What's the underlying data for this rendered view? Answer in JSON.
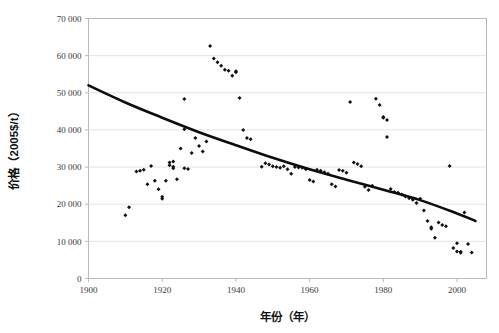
{
  "chart_data": {
    "type": "scatter",
    "title": "",
    "xlabel": "年份（年）",
    "ylabel": "价格（2005$/t）",
    "xlim": [
      1900,
      2008
    ],
    "ylim": [
      0,
      70000
    ],
    "grid": true,
    "legend": false,
    "xticks": [
      1900,
      1920,
      1940,
      1960,
      1980,
      2000
    ],
    "xtick_labels": [
      "1900",
      "1920",
      "1940",
      "1960",
      "1980",
      "2000"
    ],
    "yticks": [
      0,
      10000,
      20000,
      30000,
      40000,
      50000,
      60000,
      70000
    ],
    "ytick_labels": [
      "0",
      "10 000",
      "20 000",
      "30 000",
      "40 000",
      "50 000",
      "60 000",
      "70 000"
    ],
    "point_color": "#111111",
    "trend_color": "#0d0d0d",
    "grid_color": "#e2e2e2",
    "frame_color": "#b9b9b9",
    "series": [
      {
        "name": "价格观测值",
        "marker": "diamond",
        "points": [
          [
            1910,
            17000
          ],
          [
            1911,
            19200
          ],
          [
            1913,
            28800
          ],
          [
            1914,
            29000
          ],
          [
            1915,
            29300
          ],
          [
            1916,
            25400
          ],
          [
            1917,
            30300
          ],
          [
            1918,
            26300
          ],
          [
            1919,
            24000
          ],
          [
            1920,
            21500
          ],
          [
            1920,
            22000
          ],
          [
            1921,
            26300
          ],
          [
            1922,
            30500
          ],
          [
            1922,
            31200
          ],
          [
            1923,
            31500
          ],
          [
            1923,
            30100
          ],
          [
            1923,
            29700
          ],
          [
            1924,
            26700
          ],
          [
            1925,
            35000
          ],
          [
            1926,
            48300
          ],
          [
            1926,
            40200
          ],
          [
            1926,
            29700
          ],
          [
            1927,
            29500
          ],
          [
            1928,
            33800
          ],
          [
            1929,
            37800
          ],
          [
            1930,
            35700
          ],
          [
            1931,
            34200
          ],
          [
            1932,
            36900
          ],
          [
            1933,
            62600
          ],
          [
            1934,
            59200
          ],
          [
            1935,
            58200
          ],
          [
            1936,
            57300
          ],
          [
            1937,
            56200
          ],
          [
            1938,
            55900
          ],
          [
            1939,
            54600
          ],
          [
            1940,
            55800
          ],
          [
            1940,
            55500
          ],
          [
            1941,
            48600
          ],
          [
            1942,
            40000
          ],
          [
            1943,
            37800
          ],
          [
            1944,
            37500
          ],
          [
            1947,
            30100
          ],
          [
            1948,
            31000
          ],
          [
            1949,
            30700
          ],
          [
            1950,
            30200
          ],
          [
            1951,
            30000
          ],
          [
            1952,
            29800
          ],
          [
            1953,
            30200
          ],
          [
            1954,
            29400
          ],
          [
            1955,
            28200
          ],
          [
            1956,
            30000
          ],
          [
            1957,
            29900
          ],
          [
            1958,
            29800
          ],
          [
            1959,
            29400
          ],
          [
            1960,
            26500
          ],
          [
            1961,
            26100
          ],
          [
            1962,
            29300
          ],
          [
            1963,
            29000
          ],
          [
            1964,
            28600
          ],
          [
            1965,
            28200
          ],
          [
            1966,
            25400
          ],
          [
            1967,
            24800
          ],
          [
            1968,
            29200
          ],
          [
            1969,
            29000
          ],
          [
            1970,
            28500
          ],
          [
            1971,
            47500
          ],
          [
            1972,
            31200
          ],
          [
            1973,
            30800
          ],
          [
            1974,
            30200
          ],
          [
            1975,
            24700
          ],
          [
            1976,
            23800
          ],
          [
            1977,
            25000
          ],
          [
            1978,
            48400
          ],
          [
            1979,
            46700
          ],
          [
            1980,
            43500
          ],
          [
            1980,
            43300
          ],
          [
            1981,
            42700
          ],
          [
            1981,
            38100
          ],
          [
            1982,
            24100
          ],
          [
            1983,
            23300
          ],
          [
            1984,
            23100
          ],
          [
            1985,
            22600
          ],
          [
            1986,
            22100
          ],
          [
            1987,
            21600
          ],
          [
            1988,
            21200
          ],
          [
            1989,
            20300
          ],
          [
            1990,
            21500
          ],
          [
            1991,
            18300
          ],
          [
            1992,
            15500
          ],
          [
            1993,
            13800
          ],
          [
            1993,
            13400
          ],
          [
            1994,
            11000
          ],
          [
            1995,
            15100
          ],
          [
            1996,
            14400
          ],
          [
            1997,
            14100
          ],
          [
            1998,
            30300
          ],
          [
            1999,
            8200
          ],
          [
            2000,
            9500
          ],
          [
            2000,
            7300
          ],
          [
            2001,
            7200
          ],
          [
            2001,
            6900
          ],
          [
            2002,
            17800
          ],
          [
            2003,
            9300
          ],
          [
            2004,
            7000
          ]
        ]
      }
    ],
    "trendline": {
      "name": "趋势线",
      "type": "curve",
      "points": [
        [
          1900,
          52000
        ],
        [
          1910,
          47400
        ],
        [
          1920,
          43300
        ],
        [
          1930,
          39400
        ],
        [
          1940,
          35900
        ],
        [
          1950,
          32500
        ],
        [
          1960,
          29400
        ],
        [
          1970,
          26600
        ],
        [
          1980,
          23900
        ],
        [
          1990,
          21100
        ],
        [
          2000,
          17500
        ],
        [
          2005,
          15500
        ]
      ]
    }
  }
}
